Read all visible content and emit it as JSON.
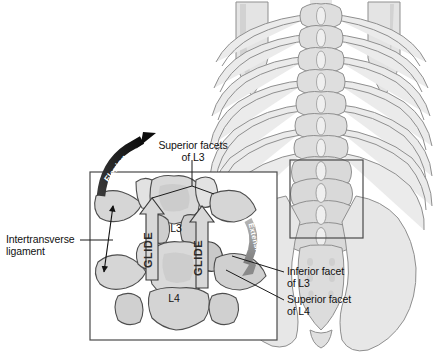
{
  "labels": {
    "superior_facets_l3": {
      "line1": "Superior facets",
      "line2": "of L3"
    },
    "intertransverse_ligament": {
      "line1": "Intertransverse",
      "line2": "ligament"
    },
    "inferior_facet_l3": {
      "line1": "Inferior facet",
      "line2": "of L3"
    },
    "superior_facet_l4": {
      "line1": "Superior facet",
      "line2": "of L4"
    },
    "vertebra_l3": "L3",
    "vertebra_l4": "L4"
  },
  "arrows": {
    "flexion": "Flexion",
    "extension": "Extension",
    "glide_left": "GLIDE",
    "glide_right": "GLIDE"
  },
  "colors": {
    "bone_light": "#e9e9e9",
    "bone_mid": "#d5d5d5",
    "bone_shade": "#bdbdbd",
    "bone_dark": "#a8a8a8",
    "outline": "#5a5a5a",
    "outline_dark": "#333333",
    "arrow_black": "#141414",
    "arrow_gray": "#8e8e8e",
    "glide_fill": "#d8d8d8",
    "box_stroke": "#4a4a4a",
    "text": "#111111",
    "background": "#ffffff"
  },
  "regions": {
    "detail_box": {
      "x": 90,
      "y": 172,
      "w": 187,
      "h": 168
    },
    "highlight_box": {
      "x": 290,
      "y": 160,
      "w": 73,
      "h": 78
    }
  }
}
